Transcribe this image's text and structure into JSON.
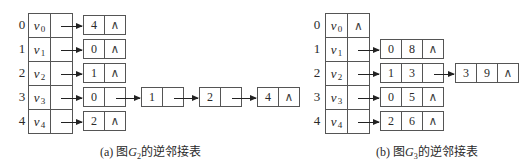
{
  "null_symbol": "∧",
  "figures": [
    {
      "id": "a",
      "caption": {
        "prefix": "(a) 图",
        "graph": "G",
        "graph_sub": "2",
        "suffix": "的逆邻接表"
      },
      "vertices": [
        {
          "index": "0",
          "name": "v",
          "sub": "0",
          "list": [
            {
              "fields": [
                "4"
              ]
            }
          ]
        },
        {
          "index": "1",
          "name": "v",
          "sub": "1",
          "list": [
            {
              "fields": [
                "0"
              ]
            }
          ]
        },
        {
          "index": "2",
          "name": "v",
          "sub": "2",
          "list": [
            {
              "fields": [
                "1"
              ]
            }
          ]
        },
        {
          "index": "3",
          "name": "v",
          "sub": "3",
          "list": [
            {
              "fields": [
                "0"
              ]
            },
            {
              "fields": [
                "1"
              ]
            },
            {
              "fields": [
                "2"
              ]
            },
            {
              "fields": [
                "4"
              ]
            }
          ]
        },
        {
          "index": "4",
          "name": "v",
          "sub": "4",
          "list": [
            {
              "fields": [
                "2"
              ]
            }
          ]
        }
      ]
    },
    {
      "id": "b",
      "caption": {
        "prefix": "(b) 图",
        "graph": "G",
        "graph_sub": "3",
        "suffix": "的逆邻接表"
      },
      "vertices": [
        {
          "index": "0",
          "name": "v",
          "sub": "0",
          "list": []
        },
        {
          "index": "1",
          "name": "v",
          "sub": "1",
          "list": [
            {
              "fields": [
                "0",
                "8"
              ]
            }
          ]
        },
        {
          "index": "2",
          "name": "v",
          "sub": "2",
          "list": [
            {
              "fields": [
                "1",
                "3"
              ]
            },
            {
              "fields": [
                "3",
                "9"
              ]
            }
          ]
        },
        {
          "index": "3",
          "name": "v",
          "sub": "3",
          "list": [
            {
              "fields": [
                "0",
                "5"
              ]
            }
          ]
        },
        {
          "index": "4",
          "name": "v",
          "sub": "4",
          "list": [
            {
              "fields": [
                "2",
                "6"
              ]
            }
          ]
        }
      ]
    }
  ]
}
